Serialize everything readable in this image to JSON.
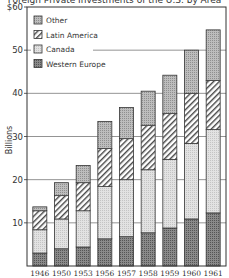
{
  "chart_data": {
    "type": "bar",
    "stacked": true,
    "title": "Foreign Private Investments of the U.S. by Area",
    "xlabel": "",
    "ylabel": "Billions",
    "ylim": [
      0,
      60
    ],
    "yticks": [
      "$60",
      "50",
      "40",
      "30",
      "20",
      "10"
    ],
    "grid": true,
    "legend_position": "upper-left",
    "categories": [
      "1946",
      "1950",
      "1953",
      "1956",
      "1957",
      "1958",
      "1959",
      "1960",
      "1961"
    ],
    "series": [
      {
        "name": "Western Europe",
        "pattern": "dark-dotted",
        "values": [
          3.0,
          4.0,
          4.4,
          6.3,
          6.8,
          7.7,
          8.8,
          10.9,
          12.3
        ]
      },
      {
        "name": "Canada",
        "pattern": "light-dotted",
        "values": [
          5.4,
          6.9,
          8.4,
          12.1,
          13.2,
          14.6,
          15.9,
          17.5,
          19.3
        ]
      },
      {
        "name": "Latin America",
        "pattern": "hatched",
        "values": [
          4.4,
          5.4,
          6.5,
          8.8,
          9.5,
          10.3,
          10.6,
          11.6,
          11.4
        ]
      },
      {
        "name": "Other",
        "pattern": "medium-dotted",
        "values": [
          0.9,
          3.0,
          4.0,
          6.3,
          7.2,
          7.9,
          8.9,
          10.0,
          11.7
        ]
      }
    ],
    "totals": [
      13.7,
      19.3,
      23.3,
      33.5,
      36.7,
      40.5,
      44.2,
      50.0,
      54.7
    ]
  },
  "legend": [
    {
      "label": "Other"
    },
    {
      "label": "Latin America"
    },
    {
      "label": "Canada"
    },
    {
      "label": "Western Europe"
    }
  ]
}
